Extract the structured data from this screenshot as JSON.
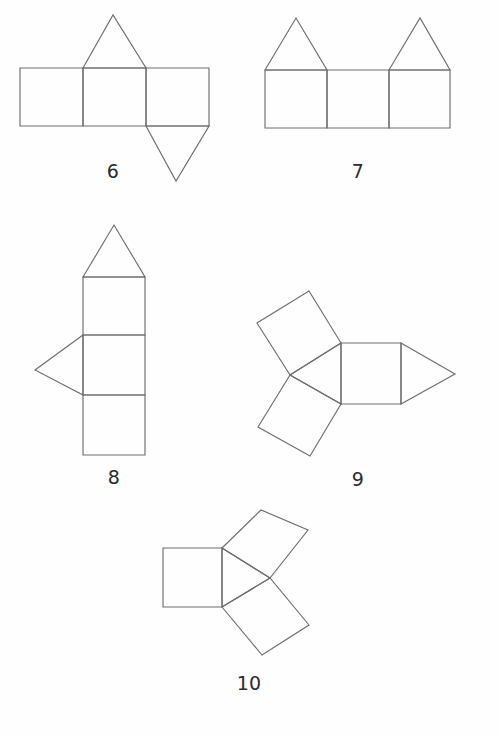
{
  "page": {
    "background_color": "#fefefe",
    "stroke_color": "#6e6e72",
    "label_color": "#2b2b2d",
    "width": 499,
    "height": 736
  },
  "figures": [
    {
      "id": "figure-6",
      "label": "6",
      "label_x": 113,
      "label_y": 160,
      "description": "Net of a triangular prism: a row of three squares with an upward triangle on the middle square and a downward triangle on the right square.",
      "shapes": [
        {
          "name": "square-left",
          "type": "polygon",
          "points": "20,68 83,68 83,126 20,126"
        },
        {
          "name": "square-middle",
          "type": "polygon",
          "points": "83,68 146,68 146,126 83,126"
        },
        {
          "name": "square-right",
          "type": "polygon",
          "points": "146,68 209,68 209,126 146,126"
        },
        {
          "name": "triangle-top",
          "type": "polygon",
          "points": "83,68 113,15 146,68"
        },
        {
          "name": "triangle-bottom",
          "type": "polygon",
          "points": "146,126 209,126 176,181"
        }
      ]
    },
    {
      "id": "figure-7",
      "label": "7",
      "label_x": 358,
      "label_y": 160,
      "description": "A row of three squares with upward triangles on the first and third squares.",
      "shapes": [
        {
          "name": "square-left",
          "type": "polygon",
          "points": "265,70 327,70 327,128 265,128"
        },
        {
          "name": "square-middle",
          "type": "polygon",
          "points": "327,70 389,70 389,128 327,128"
        },
        {
          "name": "square-right",
          "type": "polygon",
          "points": "389,70 450,70 450,128 389,128"
        },
        {
          "name": "triangle-left",
          "type": "polygon",
          "points": "265,70 296,18 327,70"
        },
        {
          "name": "triangle-right",
          "type": "polygon",
          "points": "389,70 420,18 450,70"
        }
      ]
    },
    {
      "id": "figure-8",
      "label": "8",
      "label_x": 114,
      "label_y": 466,
      "description": "A vertical column of three squares with an upward triangle on the top square and a leftward triangle on the middle square.",
      "shapes": [
        {
          "name": "square-top",
          "type": "polygon",
          "points": "83,277 145,277 145,335 83,335"
        },
        {
          "name": "square-middle",
          "type": "polygon",
          "points": "83,335 145,335 145,395 83,395"
        },
        {
          "name": "square-bottom",
          "type": "polygon",
          "points": "83,395 145,395 145,455 83,455"
        },
        {
          "name": "triangle-top",
          "type": "polygon",
          "points": "83,277 114,225 145,277"
        },
        {
          "name": "triangle-left",
          "type": "polygon",
          "points": "83,335 35,370 83,395"
        }
      ]
    },
    {
      "id": "figure-9",
      "label": "9",
      "label_x": 358,
      "label_y": 468,
      "description": "Net of a triangular prism: a central triangle with squares on its three sides (two tilted on the left, one upright on the right) and a second triangle attached to the far right edge.",
      "shapes": [
        {
          "name": "triangle-center",
          "type": "polygon",
          "points": "341,343 341,404 290,375"
        },
        {
          "name": "square-right",
          "type": "polygon",
          "points": "341,343 401,343 401,404 341,404"
        },
        {
          "name": "triangle-right",
          "type": "polygon",
          "points": "401,343 455,374 401,404"
        },
        {
          "name": "square-upper-left",
          "type": "polygon",
          "points": "341,343 290,375 257,323 309,291"
        },
        {
          "name": "square-lower-left",
          "type": "polygon",
          "points": "290,375 341,404 310,456 258,427"
        }
      ]
    },
    {
      "id": "figure-10",
      "label": "10",
      "label_x": 249,
      "label_y": 672,
      "description": "A central triangle with a square attached to each of its three sides: an upright square on the left, a square up to the right, and a tilted square below right.",
      "shapes": [
        {
          "name": "triangle-center",
          "type": "polygon",
          "points": "222,548 222,607 270,578"
        },
        {
          "name": "square-left",
          "type": "polygon",
          "points": "222,548 222,607 163,607 163,548"
        },
        {
          "name": "square-upper-right",
          "type": "polygon",
          "points": "222,548 270,578 308,530 261,510"
        },
        {
          "name": "square-lower-right",
          "type": "polygon",
          "points": "222,607 270,578 309,625 262,655"
        }
      ]
    }
  ]
}
